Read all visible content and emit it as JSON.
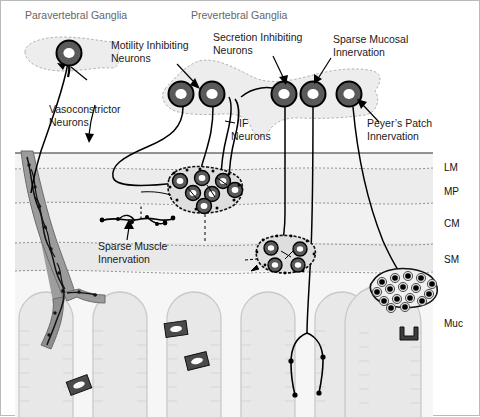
{
  "figure": {
    "title_left": "Paravertebral Ganglia",
    "title_right": "Prevertebral Ganglia"
  },
  "annotations": {
    "vasoconstrictor": {
      "line1": "Vasoconstrictor",
      "line2": "Neurons"
    },
    "motility": {
      "line1": "Motility Inhibiting",
      "line2": "Neurons"
    },
    "secretion": {
      "line1": "Secretion Inhibiting",
      "line2": "Neurons"
    },
    "sparse_mucosal": {
      "line1": "Sparse Mucosal",
      "line2": "Innervation"
    },
    "if_neurons": {
      "line1": "IF",
      "line2": "Neurons"
    },
    "peyers": {
      "line1": "Peyer’s Patch",
      "line2": "Innervation"
    },
    "sparse_muscle": {
      "line1": "Sparse Muscle",
      "line2": "Innervation"
    }
  },
  "layers": [
    {
      "code": "LM",
      "name": "longitudinal-muscle",
      "y": 166
    },
    {
      "code": "MP",
      "name": "myenteric-plexus",
      "y": 190
    },
    {
      "code": "CM",
      "name": "circular-muscle",
      "y": 222
    },
    {
      "code": "SM",
      "name": "submucosa",
      "y": 258
    },
    {
      "code": "Muc",
      "name": "mucosa",
      "y": 322
    }
  ],
  "colors": {
    "neuron_ring": "#5a5a5a",
    "neuron_core": "#ffffff",
    "neuron_outline": "#000000",
    "ganglion_fill": "#e8e8e8",
    "tissue_light": "#f2f2f2",
    "tissue_mid": "#e6e6e6",
    "vessel": "#8c8c8c",
    "villus": "#e0e0e0",
    "title_gray": "#666666",
    "label_black": "#1a1a1a",
    "fiber": "#000000"
  },
  "counts": {
    "paravertebral_neurons": 1,
    "prevertebral_neurons": 5,
    "myenteric_ganglion_neurons": 7,
    "submucosal_ganglion_neurons": 4,
    "peyers_patch_cells": 16,
    "villi": 5,
    "crypt_glands": 4
  }
}
